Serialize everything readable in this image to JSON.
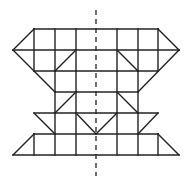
{
  "figure": {
    "colors": {
      "line": "#222222",
      "background": "#ffffff"
    },
    "grid": {
      "cols_x": [
        34,
        55,
        76,
        96,
        117,
        138,
        158
      ],
      "rows_y": [
        29,
        50,
        71,
        92,
        113,
        134,
        155
      ],
      "outer_left_x": 13,
      "outer_right_x": 179
    },
    "axis": {
      "label": "line of symmetry",
      "x": 96,
      "y1": 10,
      "y2": 176,
      "style": "dashed"
    },
    "segments": [
      [
        34,
        29,
        158,
        29
      ],
      [
        34,
        29,
        13,
        50
      ],
      [
        158,
        29,
        179,
        50
      ],
      [
        13,
        50,
        179,
        50
      ],
      [
        34,
        29,
        34,
        71
      ],
      [
        55,
        29,
        55,
        71
      ],
      [
        76,
        29,
        76,
        71
      ],
      [
        117,
        29,
        117,
        71
      ],
      [
        138,
        29,
        138,
        71
      ],
      [
        158,
        29,
        158,
        71
      ],
      [
        55,
        71,
        76,
        50
      ],
      [
        117,
        50,
        138,
        71
      ],
      [
        13,
        50,
        55,
        92
      ],
      [
        179,
        50,
        138,
        92
      ],
      [
        34,
        71,
        158,
        71
      ],
      [
        55,
        71,
        55,
        155
      ],
      [
        76,
        71,
        76,
        155
      ],
      [
        117,
        71,
        117,
        155
      ],
      [
        138,
        71,
        138,
        155
      ],
      [
        55,
        92,
        138,
        92
      ],
      [
        55,
        113,
        76,
        92
      ],
      [
        117,
        92,
        138,
        113
      ],
      [
        34,
        113,
        158,
        113
      ],
      [
        34,
        113,
        55,
        134
      ],
      [
        158,
        113,
        138,
        134
      ],
      [
        76,
        113,
        96,
        134
      ],
      [
        117,
        113,
        96,
        134
      ],
      [
        34,
        134,
        158,
        134
      ],
      [
        34,
        134,
        13,
        155
      ],
      [
        158,
        134,
        179,
        155
      ],
      [
        34,
        134,
        34,
        155
      ],
      [
        158,
        134,
        158,
        155
      ],
      [
        13,
        155,
        179,
        155
      ]
    ]
  }
}
